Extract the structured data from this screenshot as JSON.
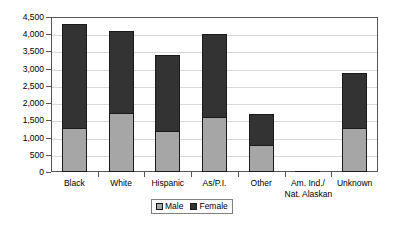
{
  "chart_data": {
    "type": "bar",
    "subtype": "stacked-bar-vertical",
    "title": "",
    "subtitle": "",
    "xlabel": "",
    "ylabel": "",
    "ylim": [
      0,
      4500
    ],
    "ytick_step": 500,
    "grid": true,
    "legend_position": "bottom-center",
    "categories": [
      "Black",
      "White",
      "Hispanic",
      "As/P.I.",
      "Other",
      "Am. Ind./ Nat. Alaskan",
      "Unknown"
    ],
    "category_lines": [
      [
        "Black"
      ],
      [
        "White"
      ],
      [
        "Hispanic"
      ],
      [
        "As/P.I."
      ],
      [
        "Other"
      ],
      [
        "Am. Ind./",
        "Nat. Alaskan"
      ],
      [
        "Unknown"
      ]
    ],
    "ytick_labels": [
      "4,500",
      "4,000",
      "3,500",
      "3,000",
      "2,500",
      "2,000",
      "1,500",
      "1,000",
      "500",
      "0"
    ],
    "ytick_values": [
      4500,
      4000,
      3500,
      3000,
      2500,
      2000,
      1500,
      1000,
      500,
      0
    ],
    "series": [
      {
        "name": "Male",
        "color": "#a6a6a6",
        "values": [
          1275,
          1700,
          1200,
          1600,
          775,
          10,
          1275
        ]
      },
      {
        "name": "Female",
        "color": "#333333",
        "values": [
          3025,
          2400,
          2200,
          2400,
          900,
          15,
          1600
        ]
      }
    ],
    "totals": [
      4300,
      4100,
      3400,
      4000,
      1675,
      25,
      2875
    ]
  },
  "legend": {
    "items": [
      {
        "label": "Male",
        "swatch": "male"
      },
      {
        "label": "Female",
        "swatch": "female"
      }
    ]
  },
  "colors": {
    "male": "#a6a6a6",
    "female": "#333333",
    "grid": "#d9d9d9",
    "axis": "#555555",
    "bar_outline": "#1a1a1a"
  }
}
